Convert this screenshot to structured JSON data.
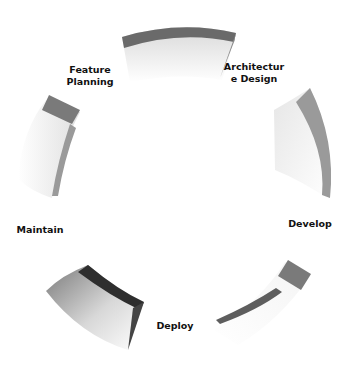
{
  "diagram": {
    "type": "cycle",
    "steps": [
      {
        "label": "Feature\nPlanning"
      },
      {
        "label": "Architectur\ne Design"
      },
      {
        "label": "Develop"
      },
      {
        "label": "Deploy"
      },
      {
        "label": "Maintain"
      }
    ],
    "colors": {
      "edge_dark": "#5a5a5a",
      "edge_mid": "#8c8c8c",
      "face_light": "#f2f2f2",
      "face_shadow": "#c8c8c8",
      "deploy_edge": "#2e2e2e"
    }
  }
}
